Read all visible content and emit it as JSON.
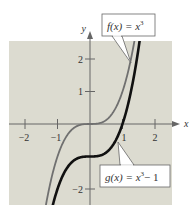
{
  "chart_data": {
    "type": "line",
    "title": "",
    "xlabel": "x",
    "ylabel": "y",
    "xlim": [
      -2.5,
      2.5
    ],
    "ylim": [
      -2.5,
      2.5
    ],
    "x_ticks": [
      -2,
      -1,
      1,
      2
    ],
    "x_tick_labels": [
      "−2",
      "−1",
      "1",
      "2"
    ],
    "y_ticks": [
      -2,
      1,
      2
    ],
    "y_tick_labels": [
      "−2",
      "1",
      "2"
    ],
    "grid": false,
    "background": "#dcdbd0",
    "series": [
      {
        "name": "f(x) = x³",
        "expression": "x^3",
        "color": "#707070",
        "x": [
          -1.35,
          -1.2,
          -1.0,
          -0.8,
          -0.6,
          -0.4,
          -0.2,
          0.0,
          0.2,
          0.4,
          0.6,
          0.8,
          1.0,
          1.2,
          1.35
        ],
        "y": [
          -2.46,
          -1.728,
          -1.0,
          -0.512,
          -0.216,
          -0.064,
          -0.008,
          0.0,
          0.008,
          0.064,
          0.216,
          0.512,
          1.0,
          1.728,
          2.46
        ]
      },
      {
        "name": "g(x) = x³ − 1",
        "expression": "x^3 - 1",
        "color": "#111111",
        "x": [
          -1.14,
          -1.0,
          -0.8,
          -0.6,
          -0.4,
          -0.2,
          0.0,
          0.2,
          0.4,
          0.6,
          0.8,
          1.0,
          1.2,
          1.4,
          1.52
        ],
        "y": [
          -2.48,
          -2.0,
          -1.512,
          -1.216,
          -1.064,
          -1.008,
          -1.0,
          -0.992,
          -0.936,
          -0.784,
          -0.488,
          0.0,
          0.728,
          1.744,
          2.51
        ]
      }
    ],
    "annotations": [
      {
        "text": "f(x) = x³",
        "series": 0
      },
      {
        "text": "g(x) = x³ − 1",
        "series": 1
      }
    ]
  },
  "labels": {
    "x_axis": "x",
    "y_axis": "y",
    "f_label_main": "f(x) = x",
    "f_label_exp": "3",
    "g_label_main": "g(x) = x",
    "g_label_exp": "3",
    "g_label_tail": "− 1",
    "xt_m2": "−2",
    "xt_m1": "−1",
    "xt_1": "1",
    "xt_2": "2",
    "yt_2": "2",
    "yt_1": "1",
    "yt_m2": "−2"
  }
}
